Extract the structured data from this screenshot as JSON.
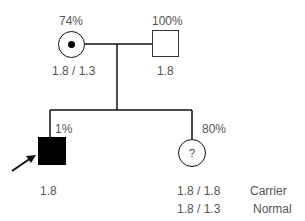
{
  "pedigree": {
    "mother": {
      "percent": "74%",
      "genotype": "1.8 / 1.3",
      "symbol": "female-carrier-circle"
    },
    "father": {
      "percent": "100%",
      "genotype": "1.8",
      "symbol": "male-unaffected-square"
    },
    "son": {
      "percent": "1%",
      "genotype": "1.8",
      "symbol": "male-affected-square",
      "proband": true
    },
    "daughter": {
      "percent": "80%",
      "symbol": "female-unknown-circle",
      "mark": "?",
      "options": [
        {
          "genotype": "1.8 / 1.8",
          "status": "Carrier"
        },
        {
          "genotype": "1.8 / 1.3",
          "status": "Normal"
        }
      ]
    }
  },
  "colors": {
    "line": "#111111",
    "text": "#555555",
    "affected": "#000000"
  }
}
